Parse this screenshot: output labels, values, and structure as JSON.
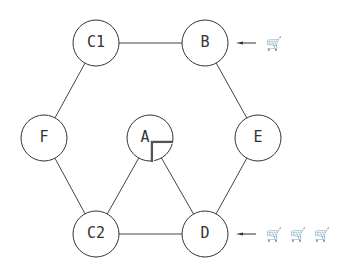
{
  "diagram": {
    "nodes": [
      {
        "id": "C1",
        "label": "C1",
        "x": 96,
        "y": 43
      },
      {
        "id": "B",
        "label": "B",
        "x": 205,
        "y": 43
      },
      {
        "id": "F",
        "label": "F",
        "x": 44,
        "y": 138
      },
      {
        "id": "A",
        "label": "A",
        "x": 150,
        "y": 138
      },
      {
        "id": "E",
        "label": "E",
        "x": 258,
        "y": 138
      },
      {
        "id": "C2",
        "label": "C2",
        "x": 96,
        "y": 234
      },
      {
        "id": "D",
        "label": "D",
        "x": 205,
        "y": 234
      }
    ],
    "edges": [
      [
        "C1",
        "B"
      ],
      [
        "C1",
        "F"
      ],
      [
        "B",
        "E"
      ],
      [
        "F",
        "C2"
      ],
      [
        "E",
        "D"
      ],
      [
        "C2",
        "D"
      ],
      [
        "A",
        "C2"
      ],
      [
        "A",
        "D"
      ]
    ],
    "arrivals": [
      {
        "node": "B",
        "count": 1,
        "glyph": "🛒"
      },
      {
        "node": "D",
        "count": 3,
        "glyph": "🛒"
      }
    ],
    "radius": 23
  }
}
